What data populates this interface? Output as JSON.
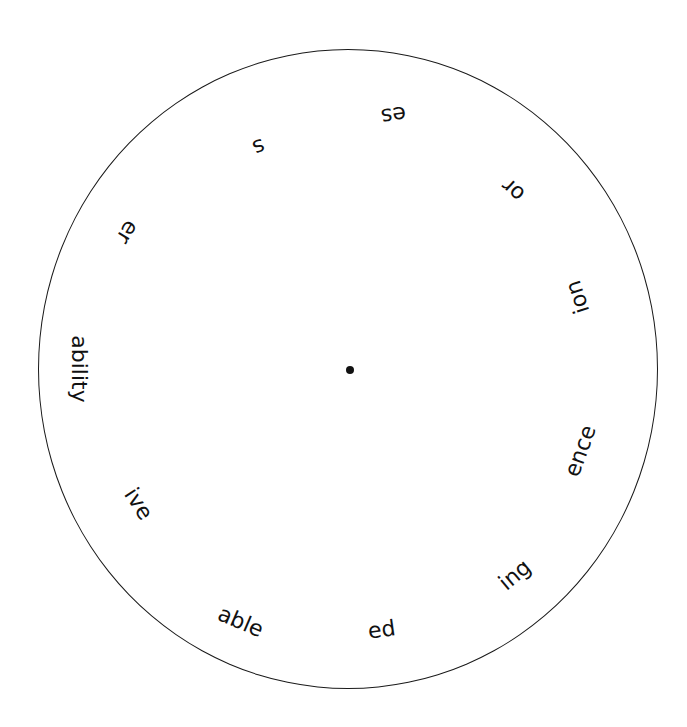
{
  "wheel": {
    "center": [
      350,
      370
    ],
    "stroke_color": "#1a1a1a",
    "suffixes": [
      {
        "text": "es",
        "x": 393,
        "y": 115,
        "rotate": 172
      },
      {
        "text": "or",
        "x": 513,
        "y": 190,
        "rotate": 222
      },
      {
        "text": "ion",
        "x": 578,
        "y": 297,
        "rotate": 252
      },
      {
        "text": "ence",
        "x": 580,
        "y": 451,
        "rotate": 290
      },
      {
        "text": "ing",
        "x": 515,
        "y": 575,
        "rotate": 320
      },
      {
        "text": "ed",
        "x": 382,
        "y": 630,
        "rotate": 352
      },
      {
        "text": "able",
        "x": 240,
        "y": 622,
        "rotate": 23
      },
      {
        "text": "ive",
        "x": 138,
        "y": 504,
        "rotate": 57
      },
      {
        "text": "ability",
        "x": 78,
        "y": 369,
        "rotate": 90
      },
      {
        "text": "er",
        "x": 127,
        "y": 232,
        "rotate": 122
      },
      {
        "text": "s",
        "x": 258,
        "y": 147,
        "rotate": 158
      }
    ]
  }
}
